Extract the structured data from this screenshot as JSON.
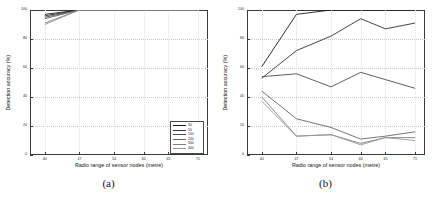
{
  "figure": {
    "panels": [
      {
        "caption": "(a)",
        "legend_position": "bottom-right"
      },
      {
        "caption": "(b)",
        "legend_position": "top-right"
      }
    ]
  },
  "axes": {
    "xlabel": "Radio range of sensor nodes (metre)",
    "ylabel": "Detection accuracy (%)",
    "xticks": [
      40,
      47,
      54,
      60,
      65,
      71
    ],
    "yticks": [
      0,
      20,
      40,
      60,
      80,
      100
    ],
    "xlim": [
      37,
      73
    ],
    "ylim": [
      0,
      100
    ]
  },
  "series_colors": [
    "#1a1a1a",
    "#333333",
    "#4d4d4d",
    "#666666",
    "#808080",
    "#999999"
  ],
  "chart_data": [
    {
      "type": "line",
      "title": "(a)",
      "xlabel": "Radio range of sensor nodes (metre)",
      "ylabel": "Detection accuracy (%)",
      "xlim": [
        37,
        73
      ],
      "ylim": [
        0,
        100
      ],
      "grid": true,
      "legend_position": "bottom-right",
      "x": [
        40,
        47,
        54,
        60,
        65,
        71
      ],
      "series": [
        {
          "name": "30",
          "values": [
            97,
            100,
            100,
            100,
            100,
            100
          ]
        },
        {
          "name": "50",
          "values": [
            96,
            100,
            100,
            100,
            100,
            100
          ]
        },
        {
          "name": "100",
          "values": [
            95,
            100,
            100,
            100,
            100,
            100
          ]
        },
        {
          "name": "200",
          "values": [
            94,
            100,
            100,
            100,
            100,
            100
          ]
        },
        {
          "name": "300",
          "values": [
            91,
            100,
            100,
            100,
            100,
            100
          ]
        },
        {
          "name": "400",
          "values": [
            90,
            100,
            100,
            100,
            100,
            100
          ]
        }
      ]
    },
    {
      "type": "line",
      "title": "(b)",
      "xlabel": "Radio range of sensor nodes (metre)",
      "ylabel": "Detection accuracy (%)",
      "xlim": [
        37,
        73
      ],
      "ylim": [
        0,
        100
      ],
      "grid": true,
      "legend_position": "top-right",
      "x": [
        40,
        47,
        54,
        60,
        65,
        71
      ],
      "series": [
        {
          "name": "30",
          "values": [
            61,
            97,
            100,
            100,
            100,
            100
          ]
        },
        {
          "name": "50",
          "values": [
            53,
            72,
            82,
            94,
            87,
            91
          ]
        },
        {
          "name": "100",
          "values": [
            54,
            56,
            47,
            57,
            52,
            46
          ]
        },
        {
          "name": "200",
          "values": [
            44,
            25,
            19,
            11,
            13,
            16
          ]
        },
        {
          "name": "300",
          "values": [
            40,
            13,
            14,
            8,
            12,
            12
          ]
        },
        {
          "name": "400",
          "values": [
            37,
            13,
            14,
            7,
            12,
            10
          ]
        }
      ]
    }
  ]
}
